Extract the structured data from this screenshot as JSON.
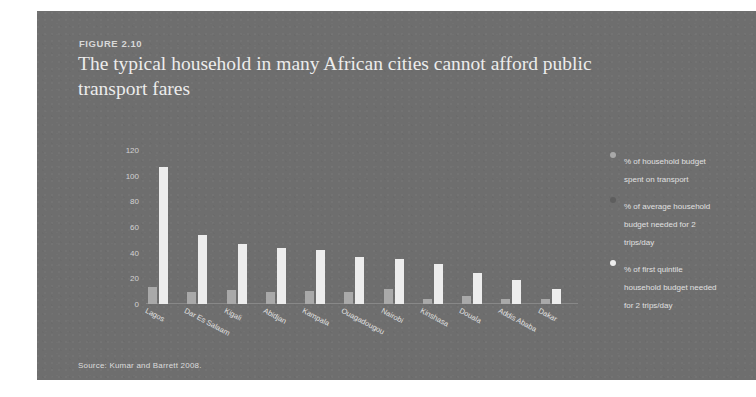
{
  "figure": {
    "number_label": "FIGURE 2.10",
    "title": "The typical household in many African cities cannot afford public transport fares",
    "source": "Source: Kumar and Barrett 2008."
  },
  "legend": {
    "position": "right",
    "items": [
      {
        "label": "% of household budget spent on transport",
        "color": "#a9a9a9"
      },
      {
        "label": "% of average household budget needed for 2 trips/day",
        "color": "#5e5e5e"
      },
      {
        "label": "% of first quintile household budget needed for 2 trips/day",
        "color": "#ededed"
      }
    ]
  },
  "chart_data": {
    "type": "bar",
    "title": "The typical household in many African cities cannot afford public transport fares",
    "xlabel": "",
    "ylabel": "",
    "ylim": [
      0,
      120
    ],
    "yticks": [
      0,
      20,
      40,
      60,
      80,
      100,
      120
    ],
    "grid": false,
    "categories": [
      "Lagos",
      "Dar Es Salaam",
      "Kigali",
      "Abidjan",
      "Kampala",
      "Ouagadougou",
      "Nairobi",
      "Kinshasa",
      "Douala",
      "Addis Ababa",
      "Dakar"
    ],
    "series": [
      {
        "name": "% of household budget spent on transport",
        "color": "#a9a9a9",
        "values": [
          13,
          9,
          11,
          9,
          10,
          9,
          12,
          4,
          6,
          4,
          4
        ]
      },
      {
        "name": "% of average household budget needed for 2 trips/day",
        "color": "#5e5e5e",
        "values": [
          0,
          0,
          0,
          0,
          0,
          0,
          0,
          0,
          0,
          0,
          0
        ]
      },
      {
        "name": "% of first quintile household budget needed for 2 trips/day",
        "color": "#ededed",
        "values": [
          107,
          54,
          47,
          44,
          42,
          37,
          35,
          31,
          24,
          19,
          12
        ]
      }
    ]
  }
}
